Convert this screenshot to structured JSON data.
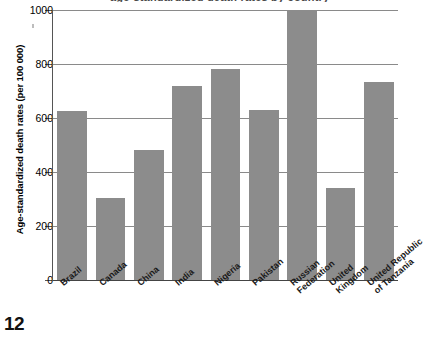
{
  "figure": {
    "title_partial": "age-standardized death rates by country",
    "page_number": "12"
  },
  "chart_data": {
    "type": "bar",
    "title": "",
    "xlabel": "",
    "ylabel": "Age-standardized death rates (per 100 000)",
    "ylim": [
      0,
      1000
    ],
    "ytick_labels": [
      "1000",
      "800",
      "600",
      "400",
      "200",
      "0"
    ],
    "ytick_values": [
      1000,
      800,
      600,
      400,
      200,
      0
    ],
    "grid": true,
    "legend": "none",
    "bar_color": "#8c8c8c",
    "categories": [
      "Brazil",
      "Canada",
      "China",
      "India",
      "Nigeria",
      "Pakistan",
      "Russian Federation",
      "United Kingdom",
      "United Republic of Tanzania"
    ],
    "category_label_lines": [
      [
        "Brazil"
      ],
      [
        "Canada"
      ],
      [
        "China"
      ],
      [
        "India"
      ],
      [
        "Nigeria"
      ],
      [
        "Pakistan"
      ],
      [
        "Russian",
        "Federation"
      ],
      [
        "United",
        "Kingdom"
      ],
      [
        "United Republic",
        "of Tanzania"
      ]
    ],
    "values": [
      625,
      305,
      480,
      720,
      780,
      630,
      1000,
      340,
      735
    ]
  }
}
